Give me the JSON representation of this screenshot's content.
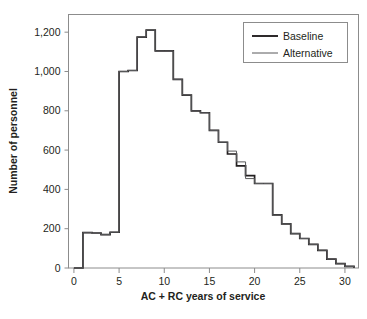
{
  "figure": {
    "title_partial": "",
    "background": "#ffffff"
  },
  "chart_data": {
    "type": "line",
    "subtype": "step-histogram",
    "title": "",
    "xlabel": "AC + RC years of service",
    "ylabel": "Number of personnel",
    "xlim": [
      -0.6,
      31.5
    ],
    "ylim": [
      0,
      1290
    ],
    "xticks": [
      0,
      5,
      10,
      15,
      20,
      25,
      30
    ],
    "xtick_labels": [
      "0",
      "5",
      "10",
      "15",
      "20",
      "25",
      "30"
    ],
    "yticks": [
      0,
      200,
      400,
      600,
      800,
      1000,
      1200
    ],
    "ytick_labels": [
      "0",
      "200",
      "400",
      "600",
      "800",
      "1,000",
      "1,200"
    ],
    "grid": false,
    "legend_position": "top-right",
    "x": [
      0,
      1,
      2,
      3,
      4,
      5,
      6,
      7,
      8,
      9,
      10,
      11,
      12,
      13,
      14,
      15,
      16,
      17,
      18,
      19,
      20,
      21,
      22,
      23,
      24,
      25,
      26,
      27,
      28,
      29,
      30
    ],
    "series": [
      {
        "name": "Baseline",
        "color": "#231f20",
        "width": 1.7,
        "values": [
          0,
          180,
          178,
          170,
          182,
          1000,
          1005,
          1175,
          1210,
          1105,
          1105,
          960,
          880,
          800,
          790,
          700,
          640,
          580,
          520,
          470,
          430,
          430,
          270,
          225,
          175,
          150,
          120,
          90,
          45,
          22,
          8
        ]
      },
      {
        "name": "Alternative",
        "color": "#58595b",
        "width": 1.0,
        "values": [
          0,
          180,
          178,
          170,
          182,
          1000,
          1005,
          1175,
          1210,
          1105,
          1105,
          960,
          880,
          800,
          790,
          700,
          640,
          595,
          540,
          455,
          430,
          430,
          270,
          225,
          175,
          150,
          120,
          90,
          45,
          22,
          8
        ]
      }
    ],
    "legend": [
      {
        "label": "Baseline",
        "color": "#231f20",
        "width": 1.9
      },
      {
        "label": "Alternative",
        "color": "#58595b",
        "width": 1.0
      }
    ]
  }
}
